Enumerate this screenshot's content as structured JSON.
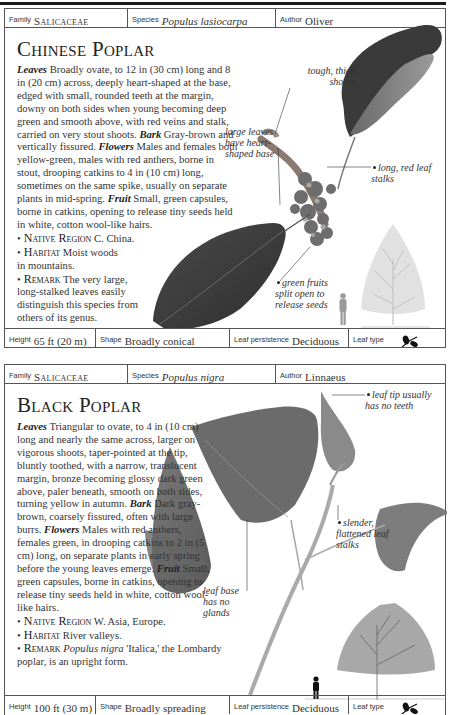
{
  "cards": [
    {
      "header": {
        "family_caption": "Family",
        "family": "Salicaceae",
        "species_caption": "Species",
        "species": "Populus lasiocarpa",
        "author_caption": "Author",
        "author": "Oliver"
      },
      "title": "Chinese Poplar",
      "description": {
        "leaves_label": "Leaves",
        "leaves": "Broadly ovate, to 12 in (30 cm) long and 8 in (20 cm) across, deeply heart-shaped at the base, edged with small, rounded teeth at the margin, downy on both sides when young becoming deep green and smooth above, with red veins and stalk, carried on very stout shoots.",
        "bark_label": "Bark",
        "bark": "Gray-brown and vertically fissured.",
        "flowers_label": "Flowers",
        "flowers": "Males and females both yellow-green, males with red anthers, borne in stout, drooping catkins to 4 in (10 cm) long, sometimes on the same spike, usually on separate plants in mid-spring.",
        "fruit_label": "Fruit",
        "fruit": "Small, green capsules, borne in catkins, opening to release tiny seeds held in white, cotton wool-like hairs."
      },
      "facts": [
        {
          "label": "Native Region",
          "text": "C. China."
        },
        {
          "label": "Habitat",
          "text": "Moist woods in mountains."
        },
        {
          "label": "Remark",
          "text": "The very large, long-stalked leaves easily distinguish this species from others of its genus."
        }
      ],
      "annotations": [
        "tough, thick shoots",
        "large leaves have heart-shaped base",
        "long, red leaf stalks",
        "green fruits split open to release seeds"
      ],
      "footer": {
        "height_caption": "Height",
        "height": "65 ft (20 m)",
        "shape_caption": "Shape",
        "shape": "Broadly conical",
        "persistence_caption": "Leaf persistence",
        "persistence": "Deciduous",
        "leaf_type_caption": "Leaf type",
        "leaf_type_icon": "leaf-sprig-icon"
      }
    },
    {
      "header": {
        "family_caption": "Family",
        "family": "Salicaceae",
        "species_caption": "Species",
        "species": "Populus nigra",
        "author_caption": "Author",
        "author": "Linnaeus"
      },
      "title": "Black Poplar",
      "description": {
        "leaves_label": "Leaves",
        "leaves": "Triangular to ovate, to 4 in (10 cm) long and nearly the same across, larger on vigorous shoots, taper-pointed at the tip, bluntly toothed, with a narrow, translucent margin, bronze becoming glossy dark green above, paler beneath, smooth on both sides, turning yellow in autumn.",
        "bark_label": "Bark",
        "bark": "Dark gray-brown, coarsely fissured, often with large burrs.",
        "flowers_label": "Flowers",
        "flowers": "Males with red anthers, females green, in drooping catkins to 2 in (5 cm) long, on separate plants in early spring before the young leaves emerge.",
        "fruit_label": "Fruit",
        "fruit": "Small, green capsules, borne in catkins, opening to release tiny seeds held in white, cotton wool-like hairs."
      },
      "facts": [
        {
          "label": "Native Region",
          "text": "W. Asia, Europe."
        },
        {
          "label": "Habitat",
          "text": "River valleys."
        },
        {
          "label": "Remark",
          "text_italic": "Populus nigra",
          "text": "'Italica,' the Lombardy poplar, is an upright form."
        }
      ],
      "annotations": [
        "leaf tip usually has no teeth",
        "slender, flattened leaf stalks",
        "leaf base has no glands"
      ],
      "footer": {
        "height_caption": "Height",
        "height": "100 ft (30 m)",
        "shape_caption": "Shape",
        "shape": "Broadly spreading",
        "persistence_caption": "Leaf persistence",
        "persistence": "Deciduous",
        "leaf_type_caption": "Leaf type",
        "leaf_type_icon": "leaf-sprig-icon"
      }
    }
  ]
}
